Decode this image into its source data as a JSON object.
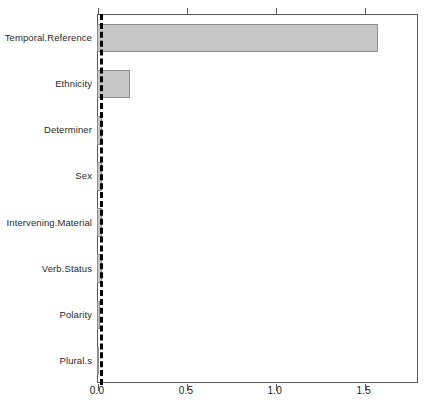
{
  "chart_data": {
    "type": "bar",
    "orientation": "horizontal",
    "title": "",
    "subtitle": "",
    "xlabel": "",
    "ylabel": "",
    "categories": [
      "Temporal.Reference",
      "Ethnicity",
      "Determiner",
      "Sex",
      "Intervening.Material",
      "Verb.Status",
      "Polarity",
      "Plural.s"
    ],
    "values": [
      1.575,
      0.18,
      0.021,
      0.021,
      0.021,
      0.021,
      0.0105,
      0.0055
    ],
    "xlim": [
      0,
      1.805
    ],
    "xticks": [
      0.0,
      0.5,
      1.0,
      1.5
    ],
    "xticklabels": [
      "0.0",
      "0.5",
      "1.0",
      "1.5"
    ],
    "grid": false,
    "legend": null,
    "reference_line": {
      "value": 0.0125,
      "style": "dashed",
      "color": "#000000",
      "orientation": "vertical"
    },
    "bar_fill_color": "#c6c6c6",
    "bar_border_color": "#8f8f8f",
    "panel_border_color": "#5a5a5a",
    "background_color": "#ffffff"
  },
  "axis": {
    "tick_0": "0.0",
    "tick_1": "0.5",
    "tick_2": "1.0",
    "tick_3": "1.5"
  },
  "labels": {
    "cat_0": "Temporal.Reference",
    "cat_1": "Ethnicity",
    "cat_2": "Determiner",
    "cat_3": "Sex",
    "cat_4": "Intervening.Material",
    "cat_5": "Verb.Status",
    "cat_6": "Polarity",
    "cat_7": "Plural.s"
  }
}
